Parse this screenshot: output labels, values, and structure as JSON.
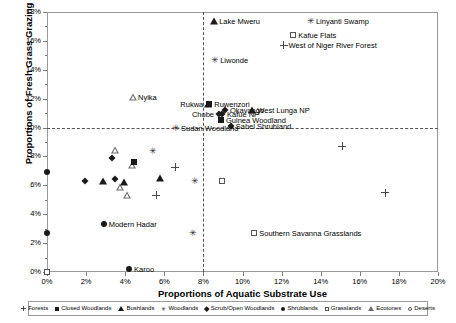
{
  "chart_data": {
    "type": "scatter",
    "title": "",
    "xlabel": "Proportions of Aquatic Substrate Use",
    "ylabel": "Proportions of Fresh Grass Grazing",
    "xlim": [
      0,
      20
    ],
    "ylim": [
      0,
      18
    ],
    "xticks": [
      "0%",
      "2%",
      "4%",
      "6%",
      "8%",
      "10%",
      "12%",
      "14%",
      "16%",
      "18%",
      "20%"
    ],
    "yticks": [
      "0%",
      "2%",
      "4%",
      "6%",
      "8%",
      "10%",
      "12%",
      "14%",
      "16%",
      "18%"
    ],
    "grid": false,
    "reference_lines": {
      "horizontal": 10,
      "vertical": 8,
      "style": "dashed"
    },
    "legend_position": "bottom",
    "legend": [
      {
        "label": "Forests",
        "marker": "plus"
      },
      {
        "label": "Closed Woodlands",
        "marker": "square"
      },
      {
        "label": "Bushlands",
        "marker": "triangle"
      },
      {
        "label": "Woodlands",
        "marker": "star"
      },
      {
        "label": "Scrub/Open Woodlands",
        "marker": "diamond"
      },
      {
        "label": "Shrublands",
        "marker": "circle"
      },
      {
        "label": "Grasslands",
        "marker": "osquare"
      },
      {
        "label": "Ecotones",
        "marker": "otriangle"
      },
      {
        "label": "Deserts",
        "marker": "ocircle"
      }
    ],
    "points": [
      {
        "x": 8.55,
        "y": 17.4,
        "marker": "triangle",
        "label": "Lake Mweru",
        "label_side": "right"
      },
      {
        "x": 13.5,
        "y": 17.4,
        "marker": "star",
        "label": "Linyanti Swamp",
        "label_side": "right"
      },
      {
        "x": 12.6,
        "y": 16.4,
        "marker": "osquare",
        "label": "Kafue Flats",
        "label_side": "right"
      },
      {
        "x": 12.1,
        "y": 15.7,
        "marker": "plus",
        "label": "West of Niger River Forest",
        "label_side": "right"
      },
      {
        "x": 8.6,
        "y": 14.7,
        "marker": "star",
        "label": "Liwonde",
        "label_side": "right"
      },
      {
        "x": 4.4,
        "y": 12.1,
        "marker": "otriangle",
        "label": "Nyika",
        "label_side": "right"
      },
      {
        "x": 8.3,
        "y": 11.6,
        "marker": "square",
        "label": "Ruwenzori",
        "label_side": "right"
      },
      {
        "x": 8.25,
        "y": 11.6,
        "marker": "triangle",
        "label": "Rukwa",
        "label_side": "left"
      },
      {
        "x": 9.1,
        "y": 11.2,
        "marker": "diamond",
        "label": "Okavango",
        "label_side": "right"
      },
      {
        "x": 8.95,
        "y": 10.95,
        "marker": "diamond",
        "label": "Kafue NP",
        "label_side": "right"
      },
      {
        "x": 8.8,
        "y": 10.95,
        "marker": "diamond",
        "label": "Chobe",
        "label_side": "left"
      },
      {
        "x": 10.5,
        "y": 11.2,
        "marker": "triangle",
        "label": "West Lunga NP",
        "label_side": "right"
      },
      {
        "x": 8.9,
        "y": 10.5,
        "marker": "square",
        "label": "Guinea Woodland",
        "label_side": "right"
      },
      {
        "x": 9.4,
        "y": 10.1,
        "marker": "diamond",
        "label": "Sahel Shrubland",
        "label_side": "right"
      },
      {
        "x": 6.6,
        "y": 10.0,
        "marker": "star",
        "label": "Sudan Woodland",
        "label_side": "right"
      },
      {
        "x": 2.9,
        "y": 3.35,
        "marker": "circle",
        "label": "Modern Hadar",
        "label_side": "right"
      },
      {
        "x": 4.2,
        "y": 0.2,
        "marker": "circle",
        "label": "Karoo",
        "label_side": "right"
      },
      {
        "x": 10.6,
        "y": 2.7,
        "marker": "osquare",
        "label": "Southern Savanna Grasslands",
        "label_side": "right"
      },
      {
        "x": 0.0,
        "y": 6.9,
        "marker": "circle",
        "label": "",
        "label_side": "right"
      },
      {
        "x": 0.0,
        "y": 2.7,
        "marker": "circle",
        "label": "",
        "label_side": "right"
      },
      {
        "x": 0.0,
        "y": 0.0,
        "marker": "osquare",
        "label": "",
        "label_side": "right"
      },
      {
        "x": 1.95,
        "y": 6.3,
        "marker": "diamond",
        "label": "",
        "label_side": "right"
      },
      {
        "x": 2.85,
        "y": 6.3,
        "marker": "triangle",
        "label": "",
        "label_side": "right"
      },
      {
        "x": 3.5,
        "y": 8.9,
        "marker": "otriangle",
        "label": "",
        "label_side": "right"
      },
      {
        "x": 4.35,
        "y": 8.35,
        "marker": "otriangle",
        "label": "",
        "label_side": "right"
      },
      {
        "x": 3.35,
        "y": 7.9,
        "marker": "diamond",
        "label": "",
        "label_side": "right"
      },
      {
        "x": 3.75,
        "y": 7.35,
        "marker": "otriangle",
        "label": "",
        "label_side": "right"
      },
      {
        "x": 4.1,
        "y": 7.25,
        "marker": "otriangle",
        "label": "",
        "label_side": "right"
      },
      {
        "x": 4.45,
        "y": 7.6,
        "marker": "square",
        "label": "",
        "label_side": "right"
      },
      {
        "x": 3.5,
        "y": 6.45,
        "marker": "diamond",
        "label": "",
        "label_side": "right"
      },
      {
        "x": 3.95,
        "y": 6.25,
        "marker": "triangle",
        "label": "",
        "label_side": "right"
      },
      {
        "x": 5.8,
        "y": 6.5,
        "marker": "triangle",
        "label": "",
        "label_side": "right"
      },
      {
        "x": 6.55,
        "y": 7.25,
        "marker": "plus",
        "label": "",
        "label_side": "right"
      },
      {
        "x": 5.4,
        "y": 8.4,
        "marker": "star",
        "label": "",
        "label_side": "right"
      },
      {
        "x": 7.55,
        "y": 6.3,
        "marker": "star",
        "label": "",
        "label_side": "right"
      },
      {
        "x": 7.45,
        "y": 2.7,
        "marker": "star",
        "label": "",
        "label_side": "right"
      },
      {
        "x": 5.6,
        "y": 5.3,
        "marker": "plus",
        "label": "",
        "label_side": "right"
      },
      {
        "x": 8.95,
        "y": 6.3,
        "marker": "osquare",
        "label": "",
        "label_side": "right"
      },
      {
        "x": 15.1,
        "y": 8.7,
        "marker": "plus",
        "label": "",
        "label_side": "right"
      },
      {
        "x": 17.3,
        "y": 5.5,
        "marker": "plus",
        "label": "",
        "label_side": "right"
      }
    ]
  }
}
